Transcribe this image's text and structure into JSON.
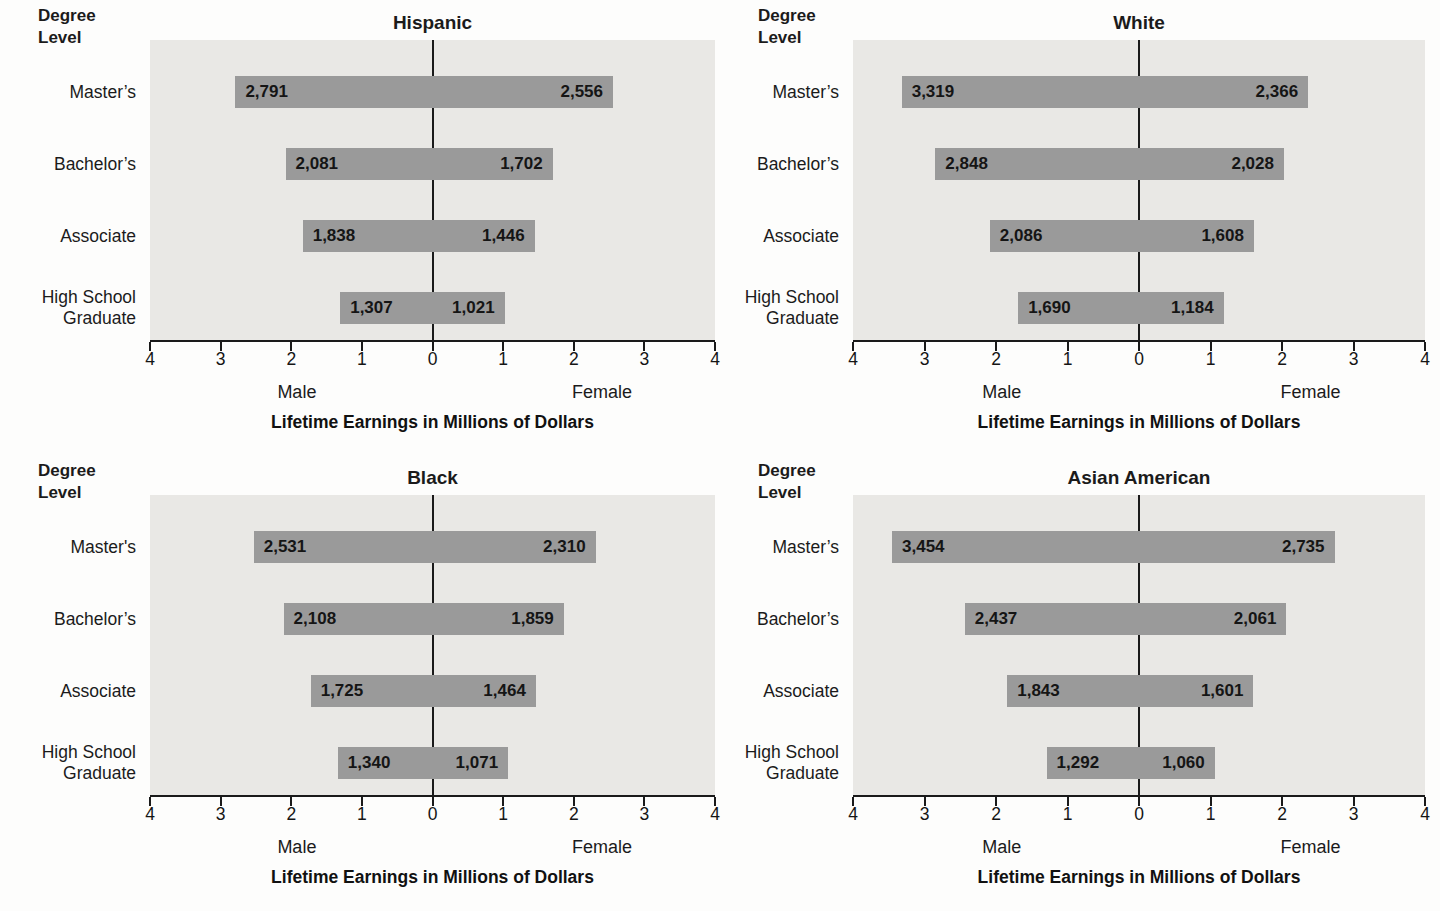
{
  "colors": {
    "bar": "#9a9a9a",
    "plot_background": "#e9e8e5",
    "axis_line": "#1a1a1a",
    "text": "#1b1b1b",
    "page_background": "#fdfdfc"
  },
  "chart_data": [
    {
      "type": "bar",
      "variant": "bidirectional-pyramid",
      "title": "Hispanic",
      "ylabel": "Degree Level",
      "ylabel_lines": [
        "Degree",
        "Level"
      ],
      "categories": [
        "Master’s",
        "Bachelor’s",
        "Associate",
        "High School Graduate"
      ],
      "series": [
        {
          "name": "Male",
          "values": [
            2791,
            2081,
            1838,
            1307
          ],
          "labels": [
            "2,791",
            "2,081",
            "1,838",
            "1,307"
          ]
        },
        {
          "name": "Female",
          "values": [
            2556,
            1702,
            1446,
            1021
          ],
          "labels": [
            "2,556",
            "1,702",
            "1,446",
            "1,021"
          ]
        }
      ],
      "xlim": [
        -4,
        4
      ],
      "axis_ticks": [
        "4",
        "3",
        "2",
        "1",
        "0",
        "1",
        "2",
        "3",
        "4"
      ],
      "left_label": "Male",
      "right_label": "Female",
      "xlabel": "Lifetime Earnings in Millions of Dollars"
    },
    {
      "type": "bar",
      "variant": "bidirectional-pyramid",
      "title": "White",
      "ylabel": "Degree Level",
      "ylabel_lines": [
        "Degree",
        "Level"
      ],
      "categories": [
        "Master’s",
        "Bachelor’s",
        "Associate",
        "High School Graduate"
      ],
      "series": [
        {
          "name": "Male",
          "values": [
            3319,
            2848,
            2086,
            1690
          ],
          "labels": [
            "3,319",
            "2,848",
            "2,086",
            "1,690"
          ]
        },
        {
          "name": "Female",
          "values": [
            2366,
            2028,
            1608,
            1184
          ],
          "labels": [
            "2,366",
            "2,028",
            "1,608",
            "1,184"
          ]
        }
      ],
      "xlim": [
        -4,
        4
      ],
      "axis_ticks": [
        "4",
        "3",
        "2",
        "1",
        "0",
        "1",
        "2",
        "3",
        "4"
      ],
      "left_label": "Male",
      "right_label": "Female",
      "xlabel": "Lifetime Earnings in Millions of Dollars"
    },
    {
      "type": "bar",
      "variant": "bidirectional-pyramid",
      "title": "Black",
      "ylabel": "Degree Level",
      "ylabel_lines": [
        "Degree",
        "Level"
      ],
      "categories": [
        "Master's",
        "Bachelor’s",
        "Associate",
        "High School Graduate"
      ],
      "series": [
        {
          "name": "Male",
          "values": [
            2531,
            2108,
            1725,
            1340
          ],
          "labels": [
            "2,531",
            "2,108",
            "1,725",
            "1,340"
          ]
        },
        {
          "name": "Female",
          "values": [
            2310,
            1859,
            1464,
            1071
          ],
          "labels": [
            "2,310",
            "1,859",
            "1,464",
            "1,071"
          ]
        }
      ],
      "xlim": [
        -4,
        4
      ],
      "axis_ticks": [
        "4",
        "3",
        "2",
        "1",
        "0",
        "1",
        "2",
        "3",
        "4"
      ],
      "left_label": "Male",
      "right_label": "Female",
      "xlabel": "Lifetime Earnings in Millions of Dollars"
    },
    {
      "type": "bar",
      "variant": "bidirectional-pyramid",
      "title": "Asian American",
      "ylabel": "Degree Level",
      "ylabel_lines": [
        "Degree",
        "Level"
      ],
      "categories": [
        "Master’s",
        "Bachelor’s",
        "Associate",
        "High School Graduate"
      ],
      "series": [
        {
          "name": "Male",
          "values": [
            3454,
            2437,
            1843,
            1292
          ],
          "labels": [
            "3,454",
            "2,437",
            "1,843",
            "1,292"
          ]
        },
        {
          "name": "Female",
          "values": [
            2735,
            2061,
            1601,
            1060
          ],
          "labels": [
            "2,735",
            "2,061",
            "1,601",
            "1,060"
          ]
        }
      ],
      "xlim": [
        -4,
        4
      ],
      "axis_ticks": [
        "4",
        "3",
        "2",
        "1",
        "0",
        "1",
        "2",
        "3",
        "4"
      ],
      "left_label": "Male",
      "right_label": "Female",
      "xlabel": "Lifetime Earnings in Millions of Dollars"
    }
  ]
}
